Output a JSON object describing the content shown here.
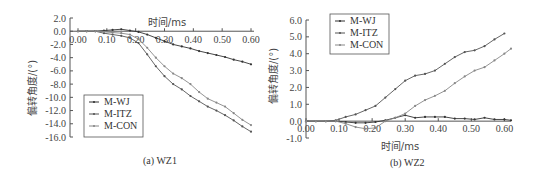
{
  "chart_data": [
    {
      "type": "line",
      "title": "(a) WZ1",
      "xlabel": "时间/ms",
      "ylabel": "偏转角度/(°)",
      "xlim": [
        0,
        0.6
      ],
      "ylim": [
        -16,
        2
      ],
      "xticks": [
        "0.00",
        "0.10",
        "0.20",
        "0.30",
        "0.40",
        "0.50",
        "0.60"
      ],
      "yticks": [
        "2.0",
        "0.0",
        "-2.0",
        "-4.0",
        "-6.0",
        "-8.0",
        "-10.0",
        "-12.0",
        "-14.0",
        "-16.0"
      ],
      "legend_position": "lower-left",
      "x": [
        0,
        0.03,
        0.06,
        0.09,
        0.12,
        0.15,
        0.18,
        0.21,
        0.24,
        0.27,
        0.3,
        0.33,
        0.36,
        0.39,
        0.42,
        0.45,
        0.48,
        0.51,
        0.54,
        0.57,
        0.6
      ],
      "series": [
        {
          "name": "M-WJ",
          "values": [
            0,
            0,
            0,
            0.1,
            0.2,
            0.3,
            0.1,
            -0.1,
            -0.5,
            -1.0,
            -1.5,
            -2.0,
            -2.3,
            -2.6,
            -3.0,
            -3.3,
            -3.6,
            -3.9,
            -4.3,
            -4.6,
            -5.0
          ]
        },
        {
          "name": "M-ITZ",
          "values": [
            0,
            0,
            0,
            -0.3,
            -0.5,
            -0.7,
            -1.0,
            -1.8,
            -3.5,
            -5.3,
            -6.8,
            -8.0,
            -8.8,
            -9.8,
            -10.6,
            -11.4,
            -12.0,
            -12.7,
            -13.5,
            -14.4,
            -15.2
          ]
        },
        {
          "name": "M-CON",
          "values": [
            0,
            0,
            0,
            -0.1,
            -0.2,
            -0.3,
            -0.5,
            -1.2,
            -2.5,
            -4.0,
            -5.3,
            -6.4,
            -7.1,
            -8.0,
            -9.2,
            -10.2,
            -10.8,
            -11.4,
            -12.4,
            -13.4,
            -14.2
          ]
        }
      ]
    },
    {
      "type": "line",
      "title": "(b) WZ2",
      "xlabel": "时间/ms",
      "ylabel": "偏转角度/(°)",
      "xlim": [
        0,
        0.62
      ],
      "ylim": [
        -1,
        6
      ],
      "xticks": [
        "0.00",
        "0.10",
        "0.20",
        "0.30",
        "0.40",
        "0.50",
        "0.60"
      ],
      "yticks": [
        "6.0",
        "5.0",
        "4.0",
        "3.0",
        "2.0",
        "1.0",
        "0.0",
        "-1.0"
      ],
      "legend_position": "upper-left",
      "x": [
        0,
        0.03,
        0.06,
        0.09,
        0.12,
        0.15,
        0.18,
        0.21,
        0.24,
        0.27,
        0.3,
        0.33,
        0.36,
        0.39,
        0.42,
        0.45,
        0.48,
        0.51,
        0.54,
        0.57,
        0.6,
        0.62
      ],
      "series": [
        {
          "name": "M-WJ",
          "values": [
            0,
            0,
            0,
            0,
            -0.05,
            -0.1,
            -0.1,
            -0.05,
            0.05,
            0.2,
            0.35,
            0.2,
            0.25,
            0.25,
            0.25,
            0.15,
            0.15,
            0.1,
            0.2,
            0.1,
            0.1,
            0.05
          ]
        },
        {
          "name": "M-ITZ",
          "values": [
            0,
            0,
            0,
            0.05,
            0.25,
            0.4,
            0.65,
            0.9,
            1.4,
            1.9,
            2.4,
            2.7,
            2.8,
            3.0,
            3.4,
            3.8,
            4.1,
            4.2,
            4.45,
            4.85,
            5.2,
            null
          ]
        },
        {
          "name": "M-CON",
          "values": [
            0,
            0,
            0,
            0,
            -0.15,
            -0.35,
            -0.45,
            -0.4,
            0,
            0.2,
            0.45,
            0.9,
            1.25,
            1.5,
            1.8,
            2.25,
            2.65,
            3.0,
            3.2,
            3.6,
            4.0,
            4.3
          ]
        }
      ]
    }
  ],
  "captions": {
    "a": "(a) WZ1",
    "b": "(b) WZ2"
  },
  "legend": [
    "M-WJ",
    "M-ITZ",
    "M-CON"
  ],
  "axis": {
    "xlabel": "时间/ms",
    "ylabel": "偏转角度/(°)"
  }
}
